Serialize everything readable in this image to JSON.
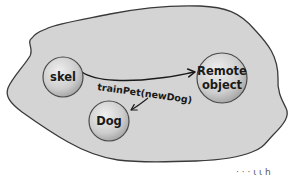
{
  "diagram": {
    "type": "object-heap-illustration",
    "colors": {
      "background": "#ffffff",
      "heap_fill": "#d4d4d4",
      "heap_outline": "#3a3a3a",
      "node_fill": "#cfcfcf",
      "node_highlight": "#ececec",
      "node_outline": "#4a4a4a",
      "arrow": "#1a1a1a",
      "text": "#1a1a1a"
    },
    "heap": {
      "name": "heap-region"
    },
    "nodes": [
      {
        "id": "skel",
        "label": "skel"
      },
      {
        "id": "remote",
        "label_line1": "Remote",
        "label_line2": "object"
      },
      {
        "id": "dog",
        "label": "Dog"
      }
    ],
    "edges": [
      {
        "from": "skel",
        "to": "remote",
        "label": "trainPet(newDog)"
      },
      {
        "from": "trainPet-label",
        "to": "dog",
        "label": ""
      }
    ],
    "cropped_fragment_text": "· · · ι  ι  h"
  }
}
